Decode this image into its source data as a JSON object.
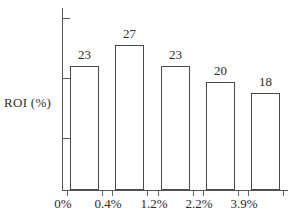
{
  "chart_data": {
    "type": "bar",
    "title": "",
    "xlabel": "",
    "ylabel": "ROI (%)",
    "categories": [
      "0%",
      "0.4%",
      "1.2%",
      "2.2%",
      "3.9%"
    ],
    "values": [
      23,
      27,
      23,
      20,
      18
    ],
    "value_labels": [
      "23",
      "27",
      "23",
      "20",
      "18"
    ],
    "ylim": [
      0,
      32
    ],
    "grid": false,
    "legend": null,
    "y_tick_count": 3,
    "bar_style": "outline",
    "colors": {
      "bar_fill": "#ffffff",
      "bar_stroke": "#4a4a4a",
      "axis": "#555555",
      "text": "#2b2b2b",
      "background": "#ffffff"
    }
  },
  "axis": {
    "y_label": "ROI (%)"
  }
}
